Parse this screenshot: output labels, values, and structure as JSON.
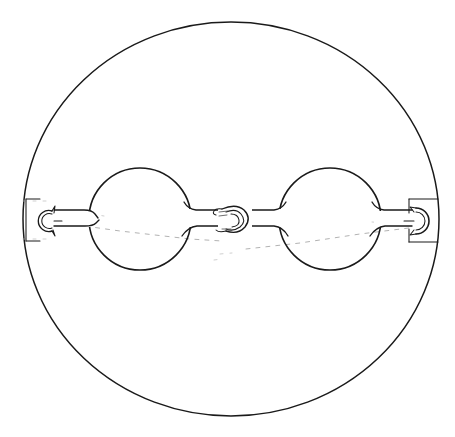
{
  "figure": {
    "title": "Folding spectacles shown within circular case outline",
    "domain_kind": "technical line drawing",
    "caption": "",
    "background_color": "#ffffff",
    "ink_color": "#1a1a1a",
    "hidden_line_color": "#9a9a9a",
    "canvas": {
      "width": 455,
      "height": 437
    }
  },
  "geometry": {
    "case_outline": {
      "name": "circular case outline",
      "shape": "ellipse",
      "center_x": 231,
      "center_y": 219,
      "radius_x": 208,
      "radius_y": 197,
      "stroke_width": 1.5
    },
    "optical_axis_y": 219,
    "left_lens": {
      "name": "left lens rim",
      "shape": "circle",
      "center_x": 140,
      "center_y": 219,
      "radius": 51,
      "stroke_width": 1.6
    },
    "right_lens": {
      "name": "right lens rim",
      "shape": "circle",
      "center_x": 330,
      "center_y": 219,
      "radius": 51,
      "stroke_width": 1.6
    },
    "bridge": {
      "name": "center hinge and bridge hook",
      "center_x": 235,
      "center_y": 219,
      "hook_radius": 9
    },
    "left_end_hook": {
      "name": "left C hook and bracket",
      "hook_center_x": 47,
      "hook_center_y": 221,
      "hook_radius": 9,
      "bracket_x": 26,
      "bracket_y": 198,
      "bracket_width": 22,
      "bracket_height": 44
    },
    "right_end_hook": {
      "name": "right C hook and bracket",
      "hook_center_x": 422,
      "hook_center_y": 221,
      "hook_radius": 10,
      "bracket_x": 409,
      "bracket_y": 198,
      "bracket_width": 30,
      "bracket_height": 44
    },
    "arms": {
      "left_outer_arm": {
        "from_x": 58,
        "to_x": 92,
        "y_top": 210,
        "y_bottom": 226
      },
      "left_inner_arm": {
        "from_x": 189,
        "to_x": 222,
        "y_top": 209,
        "y_bottom": 226
      },
      "right_inner_arm": {
        "from_x": 249,
        "to_x": 281,
        "y_top": 209,
        "y_bottom": 226
      },
      "right_outer_arm": {
        "from_x": 378,
        "to_x": 411,
        "y_top": 210,
        "y_bottom": 226
      }
    },
    "hidden_lines": [
      {
        "name": "upper hidden sight line",
        "x1": 60,
        "y1": 223,
        "x2": 222,
        "y2": 240
      },
      {
        "name": "lower hidden sight line",
        "x1": 246,
        "y1": 248,
        "x2": 408,
        "y2": 228
      },
      {
        "name": "left bracket hidden edge top",
        "x1": 24,
        "y1": 201,
        "x2": 52,
        "y2": 201
      },
      {
        "name": "left bracket hidden edge bottom",
        "x1": 24,
        "y1": 239,
        "x2": 52,
        "y2": 239
      },
      {
        "name": "center hidden tick",
        "x1": 222,
        "y1": 253,
        "x2": 236,
        "y2": 252
      }
    ]
  },
  "labels": {
    "figure_number": "",
    "annotations": []
  }
}
